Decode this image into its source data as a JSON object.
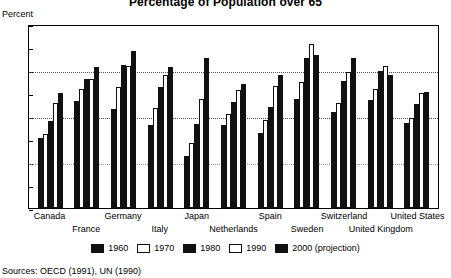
{
  "title": "Percentage of Population over 65",
  "axis_title": "Percent",
  "sources": "Sources: OECD (1991), UN (1990)",
  "legend": [
    {
      "label": "1960",
      "style": "dark"
    },
    {
      "label": "1970",
      "style": "light"
    },
    {
      "label": "1980",
      "style": "dark"
    },
    {
      "label": "1990",
      "style": "light"
    },
    {
      "label": "2000 (projection)",
      "style": "dark"
    }
  ],
  "chart_data": {
    "type": "bar",
    "title": "Percentage of Population over 65",
    "xlabel": "",
    "ylabel": "Percent",
    "ylim": [
      0,
      20
    ],
    "yticks": [
      0,
      5,
      10,
      15,
      20
    ],
    "gridlines": [
      10,
      15
    ],
    "grid": true,
    "legend_position": "bottom",
    "categories": [
      "Canada",
      "France",
      "Germany",
      "Italy",
      "Japan",
      "Netherlands",
      "Spain",
      "Sweden",
      "Switzerland",
      "United Kingdom",
      "United States"
    ],
    "series": [
      {
        "name": "1960",
        "values": [
          7.6,
          11.6,
          10.8,
          9.0,
          5.7,
          9.0,
          8.2,
          11.8,
          10.4,
          11.7,
          9.2
        ]
      },
      {
        "name": "1970",
        "values": [
          8.0,
          12.9,
          13.2,
          10.9,
          7.1,
          10.2,
          9.6,
          13.7,
          11.4,
          12.9,
          9.8
        ]
      },
      {
        "name": "1980",
        "values": [
          9.5,
          14.0,
          15.5,
          13.1,
          9.1,
          11.5,
          11.0,
          16.3,
          13.8,
          14.9,
          11.3
        ]
      },
      {
        "name": "1990",
        "values": [
          11.4,
          14.0,
          15.4,
          14.5,
          11.8,
          12.8,
          13.3,
          17.8,
          14.8,
          15.4,
          12.5
        ]
      },
      {
        "name": "2000 (projection)",
        "values": [
          12.5,
          15.3,
          17.1,
          15.3,
          16.3,
          13.5,
          14.5,
          16.6,
          16.3,
          14.5,
          12.6
        ]
      }
    ]
  },
  "xlabels_row1": [
    "Canada",
    "Germany",
    "Japan",
    "Spain",
    "Switzerland",
    "United States"
  ],
  "xlabels_row2": [
    "France",
    "Italy",
    "Netherlands",
    "Sweden",
    "United Kingdom"
  ]
}
